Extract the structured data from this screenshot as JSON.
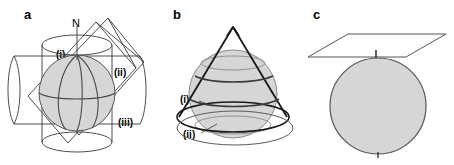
{
  "figure": {
    "width": 454,
    "height": 165,
    "background": "#ffffff"
  },
  "style": {
    "line_color": "#3a3a3a",
    "line_color_dark": "#1a1a1a",
    "globe_fill": "#d6d6d6",
    "globe_stroke": "#555555",
    "text_color": "#000000"
  },
  "panels": [
    {
      "id": "a",
      "letter": "a",
      "projection_type": "cylindrical",
      "pole_label": "N",
      "labels": [
        {
          "key": "i",
          "text": "(i)"
        },
        {
          "key": "ii",
          "text": "(ii)"
        },
        {
          "key": "iii",
          "text": "(iii)"
        }
      ]
    },
    {
      "id": "b",
      "letter": "b",
      "projection_type": "conic",
      "labels": [
        {
          "key": "i",
          "text": "(i)"
        },
        {
          "key": "ii",
          "text": "(ii)"
        }
      ]
    },
    {
      "id": "c",
      "letter": "c",
      "projection_type": "azimuthal-planar",
      "labels": []
    }
  ]
}
